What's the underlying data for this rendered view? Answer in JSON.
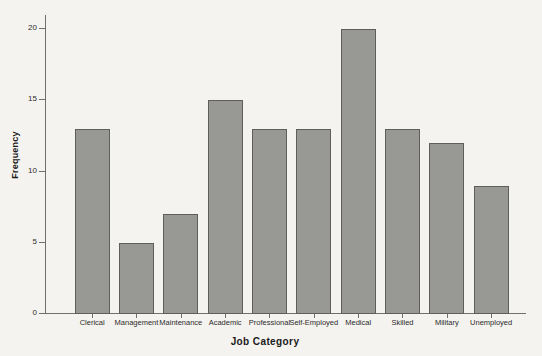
{
  "chart_data": {
    "type": "bar",
    "title": "",
    "subtitle": "",
    "xlabel": "Job Category",
    "ylabel": "Frequency",
    "categories": [
      "Clerical",
      "Management",
      "Maintenance",
      "Academic",
      "Professional",
      "Self-Employed",
      "Medical",
      "Skilled",
      "Military",
      "Unemployed"
    ],
    "values": [
      13,
      5,
      7,
      15,
      13,
      13,
      20,
      13,
      12,
      9
    ],
    "ylim": [
      0,
      21
    ],
    "ytick_values": [
      0,
      5,
      10,
      15,
      20
    ],
    "ytick_labels": [
      "0",
      "5",
      "10",
      "15",
      "20"
    ],
    "grid": false,
    "legend": null,
    "legend_position": "none",
    "annotations": [],
    "bar_fill_color": "#989894",
    "bar_edge_color": "#5e5e5b",
    "axis_color": "#6f6f6c",
    "background_color": "#f5f3ef",
    "text_color": "#1a1a1a"
  }
}
